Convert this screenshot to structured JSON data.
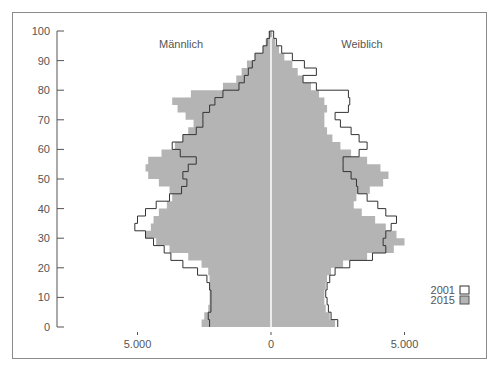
{
  "chart_data": {
    "type": "population_pyramid",
    "title": "",
    "xlabel": "",
    "ylabel": "",
    "side_labels": {
      "left": "Männlich",
      "right": "Weiblich"
    },
    "y_ticks": [
      0,
      10,
      20,
      30,
      40,
      50,
      60,
      70,
      80,
      90,
      100
    ],
    "x_ticks": [
      {
        "value": -5000,
        "label": "5.000"
      },
      {
        "value": 0,
        "label": "0"
      },
      {
        "value": 5000,
        "label": "5.000"
      }
    ],
    "ylim": [
      0,
      100
    ],
    "xlim": [
      -8000,
      8000
    ],
    "legend": [
      {
        "label": "2001",
        "style": "outline",
        "color": "#ffffff",
        "stroke": "#333333"
      },
      {
        "label": "2015",
        "style": "filled",
        "color": "#b4b4b4",
        "stroke": "#555555"
      }
    ],
    "ages": [
      0,
      2.5,
      5,
      7.5,
      10,
      12.5,
      15,
      17.5,
      20,
      22.5,
      25,
      27.5,
      30,
      32.5,
      35,
      37.5,
      40,
      42.5,
      45,
      47.5,
      50,
      52.5,
      55,
      57.5,
      60,
      62.5,
      65,
      67.5,
      70,
      72.5,
      75,
      77.5,
      80,
      82.5,
      85,
      87.5,
      90,
      92.5,
      95,
      97.5,
      100
    ],
    "series": [
      {
        "name": "2015",
        "male": [
          2600,
          2500,
          2350,
          2300,
          2300,
          2300,
          2300,
          2350,
          2600,
          3100,
          3800,
          4300,
          4700,
          4500,
          4400,
          4200,
          3900,
          3700,
          3800,
          4200,
          4600,
          4700,
          4600,
          4100,
          3600,
          3300,
          3100,
          2900,
          3200,
          3500,
          3700,
          3000,
          1800,
          1300,
          1100,
          900,
          600,
          300,
          200,
          100,
          0
        ],
        "female": [
          2400,
          2200,
          2050,
          2000,
          2000,
          2050,
          2100,
          2250,
          2700,
          3600,
          4600,
          5000,
          4700,
          4300,
          3900,
          3400,
          3100,
          3200,
          3700,
          4200,
          4400,
          4100,
          3600,
          3000,
          2600,
          2300,
          2100,
          2000,
          2000,
          2100,
          2000,
          1800,
          1500,
          1200,
          1000,
          800,
          500,
          300,
          150,
          50,
          0
        ]
      },
      {
        "name": "2001",
        "male": [
          2300,
          2350,
          2250,
          2250,
          2250,
          2300,
          2400,
          2750,
          3300,
          3750,
          4000,
          4400,
          4700,
          5100,
          5000,
          4700,
          4300,
          3800,
          3350,
          3150,
          3300,
          3100,
          2800,
          3400,
          3700,
          3300,
          2800,
          2550,
          2550,
          2300,
          2100,
          1800,
          1200,
          1000,
          850,
          700,
          600,
          300,
          150,
          50,
          0
        ],
        "female": [
          2500,
          2250,
          2150,
          2100,
          2050,
          2100,
          2200,
          2400,
          2950,
          3800,
          4300,
          4200,
          4300,
          4500,
          4700,
          4300,
          4000,
          3600,
          3250,
          3200,
          3000,
          2700,
          2700,
          3300,
          3600,
          3300,
          3000,
          2600,
          2400,
          2900,
          2950,
          2900,
          1700,
          1200,
          1700,
          1250,
          800,
          400,
          200,
          100,
          0
        ]
      }
    ],
    "colors": {
      "fill_2015": "#b4b4b4",
      "line_2001": "#333333",
      "axis": "#555555",
      "center_line": "#ffffff",
      "frame": "#8a8a8a"
    }
  }
}
